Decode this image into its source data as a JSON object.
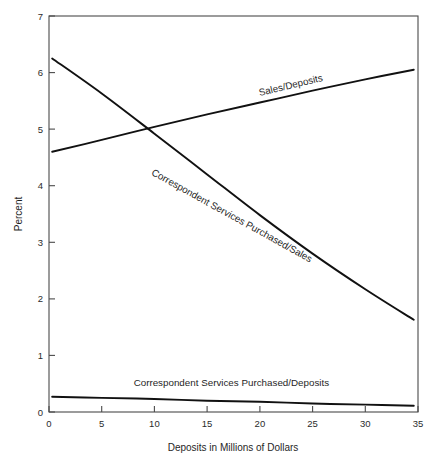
{
  "chart_data": {
    "type": "line",
    "title": "",
    "xlabel": "Deposits in Millions of Dollars",
    "ylabel": "Percent",
    "xlim": [
      0,
      35
    ],
    "ylim": [
      0,
      7
    ],
    "xticks": [
      "0",
      "5",
      "10",
      "15",
      "20",
      "25",
      "30",
      "35"
    ],
    "xtick_values": [
      0,
      5,
      10,
      15,
      20,
      25,
      30,
      35
    ],
    "yticks": [
      "0",
      "1",
      "2",
      "3",
      "4",
      "5",
      "6",
      "7"
    ],
    "ytick_values": [
      0,
      1,
      2,
      3,
      4,
      5,
      6,
      7
    ],
    "grid": false,
    "legend": "inline-labels",
    "series": [
      {
        "name": "Sales/Deposits",
        "label": "Sales/Deposits",
        "label_x": 23.0,
        "label_y": 5.72,
        "label_rotation": -13.5,
        "x": [
          0.3,
          5,
          10,
          15,
          20,
          25,
          30,
          34.6
        ],
        "y": [
          4.6,
          4.81,
          5.04,
          5.26,
          5.47,
          5.68,
          5.88,
          6.05
        ]
      },
      {
        "name": "Correspondent Services Purchased/Sales",
        "label": "Correspondent Services Purchased/Sales",
        "label_x": 17.2,
        "label_y": 3.42,
        "label_rotation": 29.0,
        "x": [
          0.3,
          5,
          10,
          15,
          20,
          25,
          30,
          34.6
        ],
        "y": [
          6.25,
          5.63,
          4.92,
          4.2,
          3.48,
          2.8,
          2.17,
          1.63
        ]
      },
      {
        "name": "Correspondent Services Purchased/Deposits",
        "label": "Correspondent Services Purchased/Deposits",
        "label_x": 17.3,
        "label_y": 0.46,
        "label_rotation": 0,
        "x": [
          0.3,
          5,
          10,
          15,
          20,
          25,
          30,
          34.6
        ],
        "y": [
          0.27,
          0.25,
          0.23,
          0.2,
          0.18,
          0.15,
          0.13,
          0.11
        ]
      }
    ],
    "crossover": {
      "x": 8.9,
      "y": 4.93
    }
  },
  "figure": {
    "caption_fragment": ""
  }
}
